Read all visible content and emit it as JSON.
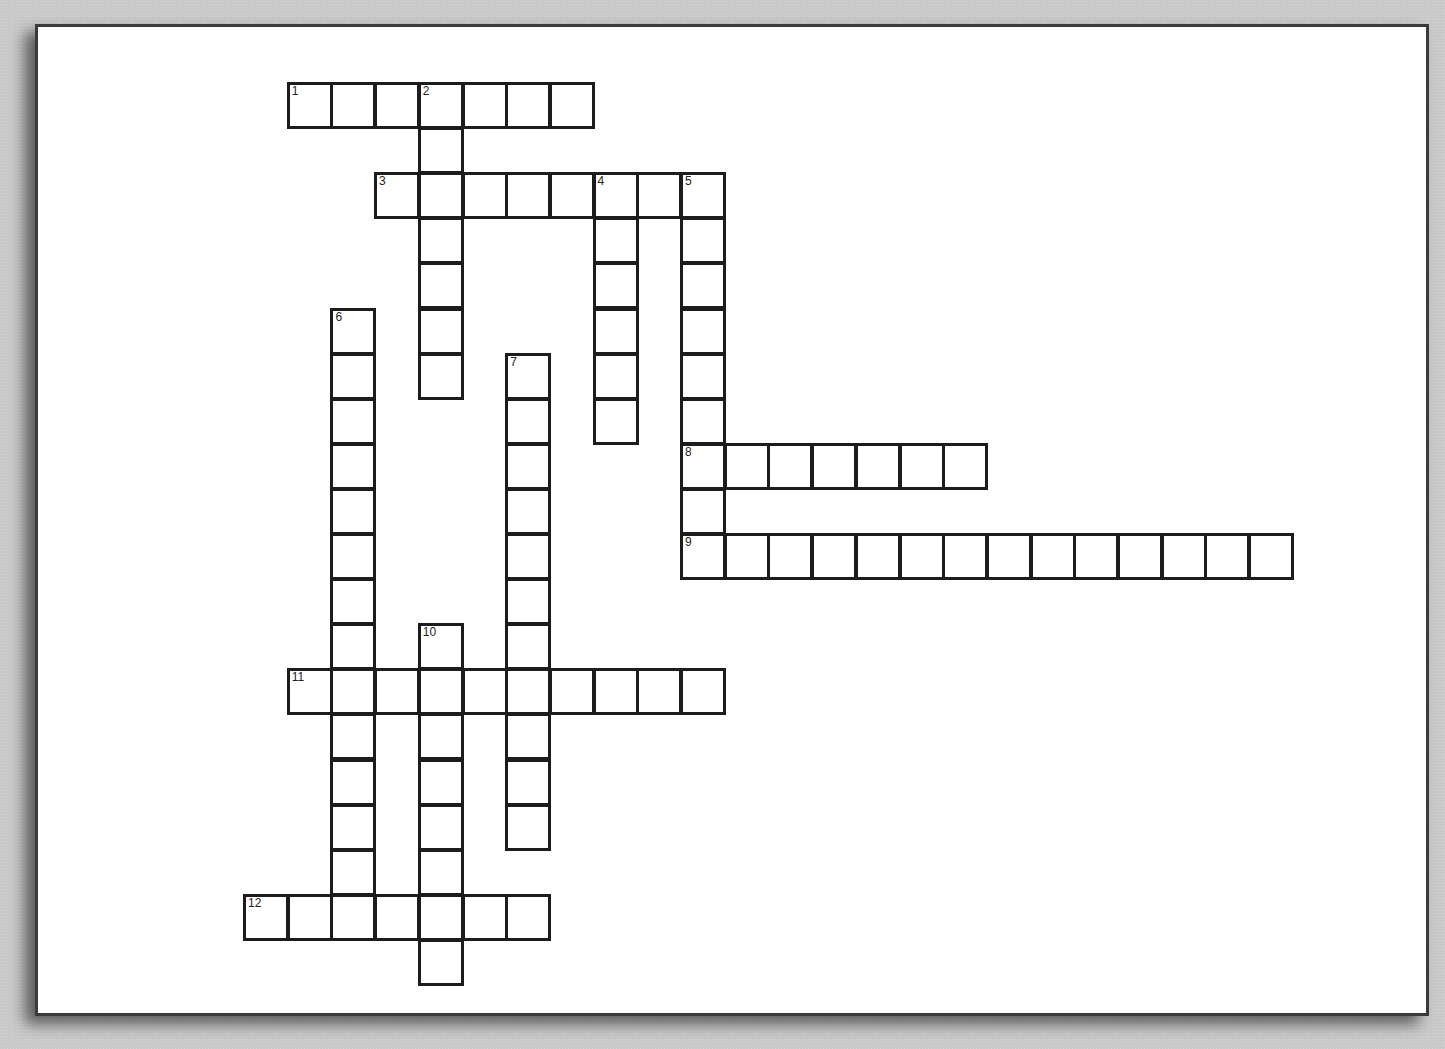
{
  "puzzle": {
    "type": "crossword",
    "grid": {
      "origin_x": 243,
      "origin_y": 82,
      "cell_w": 43.7,
      "cell_h": 45.1
    },
    "entries": [
      {
        "number": "1",
        "direction": "across",
        "row": 0,
        "col": 1,
        "length": 7
      },
      {
        "number": "2",
        "direction": "down",
        "row": 0,
        "col": 4,
        "length": 7
      },
      {
        "number": "3",
        "direction": "across",
        "row": 2,
        "col": 3,
        "length": 8
      },
      {
        "number": "4",
        "direction": "down",
        "row": 2,
        "col": 8,
        "length": 6
      },
      {
        "number": "5",
        "direction": "down",
        "row": 2,
        "col": 10,
        "length": 9
      },
      {
        "number": "6",
        "direction": "down",
        "row": 5,
        "col": 2,
        "length": 13
      },
      {
        "number": "7",
        "direction": "down",
        "row": 6,
        "col": 6,
        "length": 11
      },
      {
        "number": "8",
        "direction": "across",
        "row": 8,
        "col": 10,
        "length": 7
      },
      {
        "number": "9",
        "direction": "across",
        "row": 10,
        "col": 10,
        "length": 14
      },
      {
        "number": "10",
        "direction": "down",
        "row": 12,
        "col": 4,
        "length": 8
      },
      {
        "number": "11",
        "direction": "across",
        "row": 13,
        "col": 1,
        "length": 10
      },
      {
        "number": "12",
        "direction": "across",
        "row": 18,
        "col": 0,
        "length": 7
      }
    ]
  },
  "colors": {
    "background": "#c9c9c9",
    "sheet": "#ffffff",
    "cell_border": "#1c1c1c"
  }
}
